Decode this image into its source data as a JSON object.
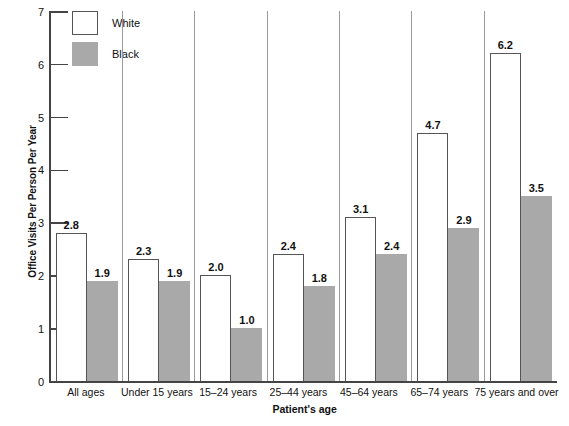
{
  "chart_data": {
    "type": "bar",
    "title": "",
    "xlabel": "Patient's age",
    "ylabel": "Office Visits Per Person Per Year",
    "categories": [
      "All ages",
      "Under 15 years",
      "15–24 years",
      "25–44 years",
      "45–64 years",
      "65–74 years",
      "75 years and over"
    ],
    "series": [
      {
        "name": "White",
        "color": "#ffffff",
        "values": [
          2.8,
          2.3,
          2.0,
          2.4,
          3.1,
          4.7,
          6.2
        ],
        "labels": [
          "2.8",
          "2.3",
          "2.0",
          "2.4",
          "3.1",
          "4.7",
          "6.2"
        ]
      },
      {
        "name": "Black",
        "color": "#a9a9a9",
        "values": [
          1.9,
          1.9,
          1.0,
          1.8,
          2.4,
          2.9,
          3.5
        ],
        "labels": [
          "1.9",
          "1.9",
          "1.0",
          "1.8",
          "2.4",
          "2.9",
          "3.5"
        ]
      }
    ],
    "ylim": [
      0,
      7
    ],
    "yticks": [
      0,
      1,
      2,
      3,
      4,
      5,
      6,
      7
    ],
    "ytick_labels": [
      "0",
      "1",
      "2",
      "3",
      "4",
      "5",
      "6",
      "7"
    ],
    "grid": false,
    "legend_position": "top-left"
  },
  "legend": {
    "items": [
      {
        "label": "White",
        "swatch": "white"
      },
      {
        "label": "Black",
        "swatch": "black"
      }
    ]
  },
  "axes": {
    "y_title": "Office Visits Per Person Per Year",
    "x_title": "Patient's age"
  }
}
